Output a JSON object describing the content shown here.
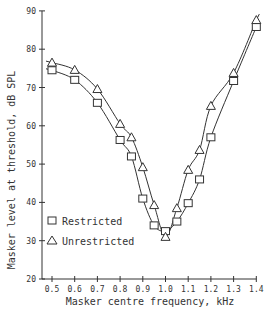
{
  "chart_data": {
    "type": "line",
    "title": "",
    "xlabel": "Masker centre frequency, kHz",
    "ylabel": "Masker level at threshold, dB SPL",
    "xlim": [
      0.45,
      1.42
    ],
    "ylim": [
      20,
      90
    ],
    "x_ticks": [
      0.5,
      0.6,
      0.7,
      0.8,
      0.9,
      1.0,
      1.1,
      1.2,
      1.3,
      1.4
    ],
    "x_tick_labels": [
      "0.5",
      "0.6",
      "0.7",
      "0.8",
      "0.9",
      "1.0",
      "1.1",
      "1.2",
      "1.3",
      "1.4"
    ],
    "y_ticks": [
      20,
      30,
      40,
      50,
      60,
      70,
      80,
      90
    ],
    "y_tick_labels": [
      "20",
      "30",
      "40",
      "50",
      "60",
      "70",
      "80",
      "90"
    ],
    "grid": false,
    "legend_position": "lower-left inside",
    "series": [
      {
        "name": "Restricted",
        "marker": "square",
        "x": [
          0.5,
          0.6,
          0.7,
          0.8,
          0.85,
          0.9,
          0.95,
          1.0,
          1.05,
          1.1,
          1.15,
          1.2,
          1.3,
          1.4
        ],
        "values": [
          74.5,
          72,
          66,
          56.3,
          52,
          41,
          34,
          32.5,
          35,
          39.8,
          46,
          57,
          71.7,
          85.8
        ]
      },
      {
        "name": "Unrestricted",
        "marker": "triangle",
        "x": [
          0.5,
          0.6,
          0.7,
          0.8,
          0.85,
          0.9,
          0.95,
          1.0,
          1.05,
          1.1,
          1.15,
          1.2,
          1.3,
          1.4
        ],
        "values": [
          76.5,
          74.6,
          69.6,
          60.5,
          57,
          49.2,
          39.3,
          31,
          38.5,
          48.5,
          53.7,
          65.2,
          73.8,
          87.6
        ]
      }
    ]
  },
  "legend": {
    "items": [
      {
        "label": "Restricted",
        "marker": "square"
      },
      {
        "label": "Unrestricted",
        "marker": "triangle"
      }
    ]
  }
}
